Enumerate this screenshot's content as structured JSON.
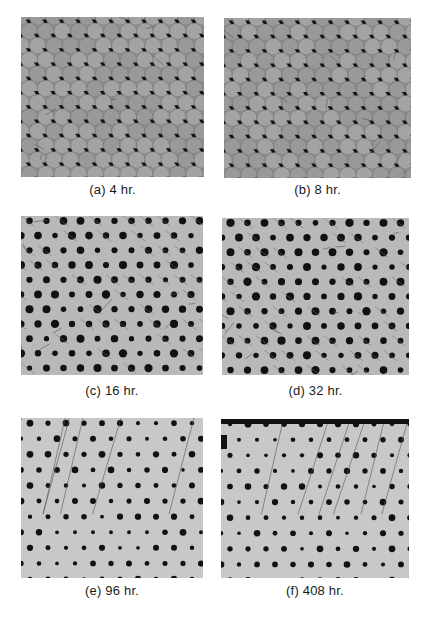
{
  "figure": {
    "panels": [
      {
        "id": "a",
        "caption": "(a) 4 hr.",
        "stage": "early",
        "x": 21,
        "y": 17,
        "w": 183,
        "h": 160,
        "cap_x": 21,
        "cap_y": 182
      },
      {
        "id": "b",
        "caption": "(b) 8 hr.",
        "stage": "early",
        "x": 224,
        "y": 18,
        "w": 187,
        "h": 160,
        "cap_x": 224,
        "cap_y": 182
      },
      {
        "id": "c",
        "caption": "(c) 16 hr.",
        "stage": "mid",
        "x": 21,
        "y": 216,
        "w": 182,
        "h": 159,
        "cap_x": 21,
        "cap_y": 383
      },
      {
        "id": "d",
        "caption": "(d) 32 hr.",
        "stage": "mid",
        "x": 222,
        "y": 218,
        "w": 187,
        "h": 157,
        "cap_x": 222,
        "cap_y": 383
      },
      {
        "id": "e",
        "caption": "(e) 96 hr.",
        "stage": "late",
        "x": 21,
        "y": 418,
        "w": 182,
        "h": 160,
        "cap_x": 21,
        "cap_y": 583
      },
      {
        "id": "f",
        "caption": "(f) 408 hr.",
        "stage": "late",
        "x": 221,
        "y": 419,
        "w": 188,
        "h": 159,
        "cap_x": 221,
        "cap_y": 583
      }
    ]
  },
  "colors": {
    "background": "#ffffff",
    "micrograph_dark_gray": "#8f8f8f",
    "micrograph_light_gray": "#c8c8c8",
    "pore_black": "#111111",
    "caption_text": "#1a1a1a"
  }
}
